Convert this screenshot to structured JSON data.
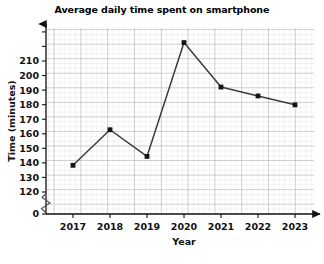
{
  "chart_data": {
    "type": "line",
    "title": "Average daily time spent on smartphone",
    "xlabel": "Year",
    "ylabel": "Time (minutes)",
    "categories": [
      "2017",
      "2018",
      "2019",
      "2020",
      "2021",
      "2022",
      "2023"
    ],
    "x": [
      2017,
      2018,
      2019,
      2020,
      2021,
      2022,
      2023
    ],
    "values": [
      135,
      155,
      140,
      204,
      179,
      174,
      169
    ],
    "series": [
      {
        "name": "Average daily time spent on smartphone",
        "values": [
          135,
          155,
          140,
          204,
          179,
          174,
          169
        ]
      }
    ],
    "ylim": [
      120,
      215
    ],
    "yticks": [
      0,
      120,
      130,
      140,
      150,
      160,
      170,
      180,
      190,
      200,
      210
    ],
    "ytick_labels": [
      "0",
      "120",
      "130",
      "140",
      "150",
      "160",
      "170",
      "180",
      "190",
      "200",
      "210"
    ],
    "xticks": [
      2017,
      2018,
      2019,
      2020,
      2021,
      2022,
      2023
    ],
    "xtick_labels": [
      "2017",
      "2018",
      "2019",
      "2020",
      "2021",
      "2022",
      "2023"
    ],
    "grid": true,
    "grid_minor": true,
    "minor_per_major": 5,
    "legend": false,
    "legend_position": "none",
    "y_axis_break": true,
    "y_axis_break_between": [
      0,
      120
    ],
    "marker": "square",
    "line_color": "#3c3c3c",
    "marker_color": "#141414",
    "grid_major_color": "#9a9a9a",
    "grid_minor_color": "#d4d4d4",
    "axis_color": "#1a1a1a",
    "x_axis_arrow": true,
    "y_axis_arrow": true,
    "annotations": []
  }
}
